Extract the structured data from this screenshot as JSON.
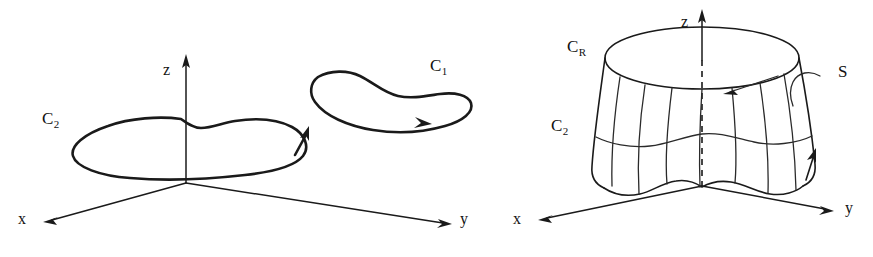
{
  "figure": {
    "type": "line-diagram",
    "background_color": "#ffffff",
    "ink_color": "#1a1a1a",
    "panels": [
      {
        "id": "left-panel",
        "name": "two-closed-curves",
        "axes": {
          "x_label": "x",
          "y_label": "y",
          "z_label": "z",
          "origin_note": "axes meet at a common origin"
        },
        "curves": [
          {
            "label": "C",
            "subscript": "2",
            "full_label": "C2",
            "orientation_arrow": "upward on right side",
            "position": "left, encircling the z-axis"
          },
          {
            "label": "C",
            "subscript": "1",
            "full_label": "C1",
            "orientation_arrow": "rightward on lower edge",
            "position": "upper right, separate loop"
          }
        ]
      },
      {
        "id": "right-panel",
        "name": "surface-bounded-by-curves",
        "axes": {
          "x_label": "x",
          "y_label": "y",
          "z_label": "z"
        },
        "curves": [
          {
            "label": "C",
            "subscript": "R",
            "full_label": "CR",
            "position": "top circular rim of the surface"
          },
          {
            "label": "C",
            "subscript": "2",
            "full_label": "C2",
            "position": "lower wavy boundary of the surface",
            "orientation_arrow": "upward on right side"
          }
        ],
        "surface": {
          "label": "S",
          "leader": "curved leader line from label to surface",
          "normal_arrow": "arrow pointing into the surface near the top rim",
          "axis_hidden_segment": "dashed vertical line from top rim to origin"
        }
      }
    ]
  },
  "labels": {
    "left_c2": "C",
    "left_c2_sub": "2",
    "left_c1": "C",
    "left_c1_sub": "1",
    "left_x": "x",
    "left_y": "y",
    "left_z": "z",
    "right_cr": "C",
    "right_cr_sub": "R",
    "right_c2": "C",
    "right_c2_sub": "2",
    "right_s": "S",
    "right_x": "x",
    "right_y": "y",
    "right_z": "z"
  }
}
